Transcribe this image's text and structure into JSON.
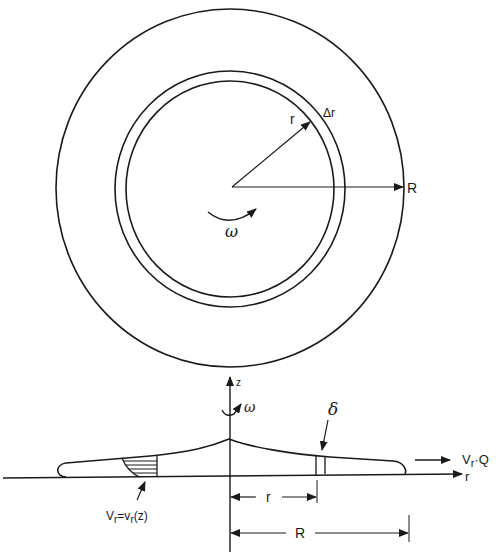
{
  "top_view": {
    "title": "Top view of spinning disk",
    "radius_r_label": "r",
    "delta_r_label": "Δr",
    "radius_R_label": "R",
    "omega_label": "ω"
  },
  "side_view": {
    "title": "Cross-section of fluid film",
    "z_axis_label": "z",
    "r_axis_label": "r",
    "omega_label": "ω",
    "thickness_label": "δ",
    "flow_label_main": "V",
    "flow_label_sub": "r",
    "flow_label_tail": "·Q",
    "velocity_profile_label_a": "V",
    "velocity_profile_sub_a": "r",
    "velocity_profile_mid": "=v",
    "velocity_profile_sub_b": "r",
    "velocity_profile_tail": "(z)",
    "dim_r_label": "r",
    "dim_R_label": "R"
  },
  "colors": {
    "ink": "#1a1a1a",
    "background": "#ffffff"
  }
}
